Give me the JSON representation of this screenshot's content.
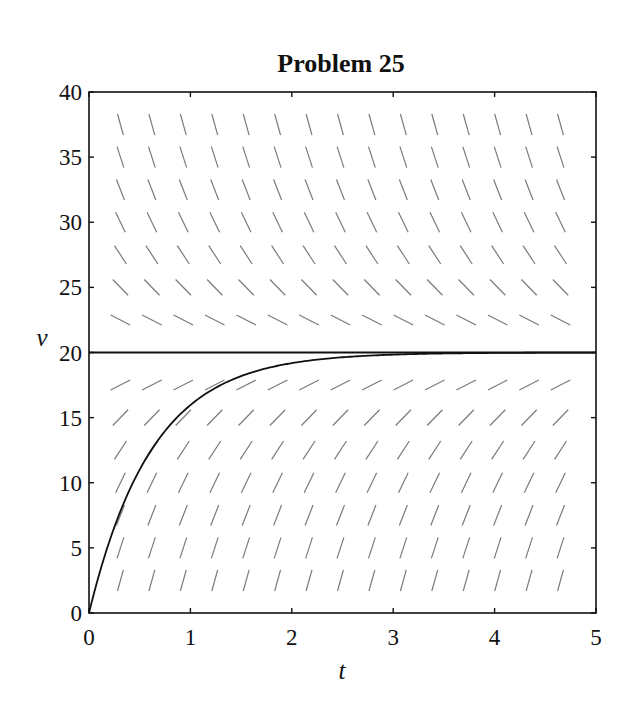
{
  "chart_data": {
    "type": "line",
    "title": "Problem 25",
    "xlabel": "t",
    "ylabel": "v",
    "xlim": [
      0,
      5
    ],
    "ylim": [
      0,
      40
    ],
    "xticks": [
      0,
      1,
      2,
      3,
      4,
      5
    ],
    "yticks": [
      0,
      5,
      10,
      15,
      20,
      25,
      30,
      35,
      40
    ],
    "grid": false,
    "legend": null,
    "slope_field": {
      "equation": "dv/dt = 32 - 1.6 v",
      "t_values": [
        0.31,
        0.62,
        0.93,
        1.24,
        1.55,
        1.86,
        2.17,
        2.48,
        2.79,
        3.1,
        3.41,
        3.72,
        4.03,
        4.34,
        4.65
      ],
      "v_values": [
        2.5,
        5,
        7.5,
        10,
        12.5,
        15,
        17.5,
        22.5,
        25,
        27.5,
        30,
        32.5,
        35,
        37.5
      ],
      "color": "#7a7a7a"
    },
    "series": [
      {
        "name": "equilibrium v = 20",
        "x": [
          0,
          5
        ],
        "y": [
          20,
          20
        ],
        "color": "#111111"
      },
      {
        "name": "solution v(t) = 20(1 - e^(-1.6t))",
        "x": [
          0,
          0.25,
          0.5,
          0.75,
          1.0,
          1.25,
          1.5,
          1.75,
          2.0,
          2.5,
          3.0,
          3.5,
          4.0,
          4.5,
          5.0
        ],
        "y": [
          0,
          6.6,
          11.0,
          14.0,
          16.0,
          17.3,
          18.2,
          18.8,
          19.2,
          19.6,
          19.84,
          19.93,
          19.97,
          19.99,
          20.0
        ],
        "color": "#111111"
      }
    ]
  }
}
